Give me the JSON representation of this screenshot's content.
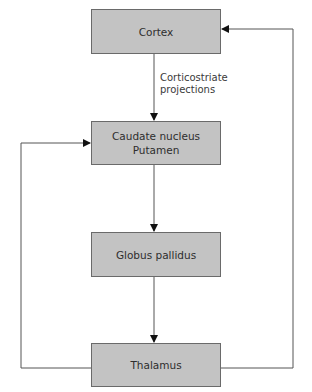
{
  "diagram": {
    "type": "flowchart",
    "nodes": [
      {
        "id": "cortex",
        "lines": [
          "Cortex"
        ]
      },
      {
        "id": "caudate",
        "lines": [
          "Caudate nucleus",
          "Putamen"
        ]
      },
      {
        "id": "globus",
        "lines": [
          "Globus pallidus"
        ]
      },
      {
        "id": "thalamus",
        "lines": [
          "Thalamus"
        ]
      }
    ],
    "edges": [
      {
        "from": "cortex",
        "to": "caudate",
        "label": [
          "Corticostriate",
          "projections"
        ]
      },
      {
        "from": "caudate",
        "to": "globus",
        "label": []
      },
      {
        "from": "globus",
        "to": "thalamus",
        "label": []
      },
      {
        "from": "thalamus",
        "to": "caudate",
        "label": [],
        "route": "left loop"
      },
      {
        "from": "thalamus",
        "to": "cortex",
        "label": [],
        "route": "right loop"
      }
    ],
    "colors": {
      "box_fill": "#c3c3c3",
      "box_border": "#6a6a6a",
      "line": "#555555",
      "text": "#2e2e2e"
    }
  }
}
